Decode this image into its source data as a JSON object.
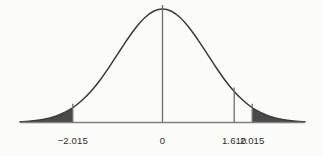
{
  "chart_data": {
    "type": "line",
    "title": "",
    "subtitle": "",
    "xlabel": "",
    "ylabel": "",
    "grid": false,
    "legend": null,
    "xlim": [
      -3.2,
      3.2
    ],
    "ylim": [
      0,
      1
    ],
    "axis": {
      "baseline_visible": true,
      "y_axis_visible": false,
      "tick_direction": "up"
    },
    "tick_labels": [
      "−2.015",
      "0",
      "1.610",
      "2.015"
    ],
    "tick_values": [
      -2.015,
      0,
      1.61,
      2.015
    ],
    "vertical_lines": [
      {
        "label": "−2.015",
        "value": -2.015,
        "is_shade_boundary": true
      },
      {
        "label": "0",
        "value": 0,
        "is_shade_boundary": false
      },
      {
        "label": "1.610",
        "value": 1.61,
        "is_shade_boundary": false
      },
      {
        "label": "2.015",
        "value": 2.015,
        "is_shade_boundary": true
      }
    ],
    "shaded_regions": [
      {
        "name": "left-tail",
        "from": -3.2,
        "to": -2.015
      },
      {
        "name": "right-tail",
        "from": 2.015,
        "to": 3.2
      }
    ],
    "curve": {
      "name": "normal-density",
      "x": [
        -3.2,
        -3.0,
        -2.8,
        -2.6,
        -2.4,
        -2.2,
        -2.015,
        -1.8,
        -1.6,
        -1.4,
        -1.2,
        -1.0,
        -0.8,
        -0.6,
        -0.4,
        -0.2,
        0.0,
        0.2,
        0.4,
        0.6,
        0.8,
        1.0,
        1.2,
        1.4,
        1.61,
        1.8,
        2.015,
        2.2,
        2.4,
        2.6,
        2.8,
        3.0,
        3.2
      ],
      "y": [
        0.006,
        0.011,
        0.02,
        0.034,
        0.056,
        0.089,
        0.13,
        0.198,
        0.278,
        0.375,
        0.487,
        0.607,
        0.726,
        0.835,
        0.923,
        0.98,
        1.0,
        0.98,
        0.923,
        0.835,
        0.726,
        0.607,
        0.487,
        0.375,
        0.273,
        0.198,
        0.13,
        0.089,
        0.056,
        0.034,
        0.02,
        0.011,
        0.006
      ]
    },
    "colors": {
      "background": "#fbfbfa",
      "curve": "#3a3a3a",
      "shade_fill": "#4a4a4a",
      "axis": "#808080",
      "marker_line": "#6e6e6e",
      "label_text": "#2e2e2e"
    }
  },
  "labels": {
    "left_boundary": "−2.015",
    "center": "0",
    "inner_right": "1.610",
    "right_boundary": "2.015"
  }
}
